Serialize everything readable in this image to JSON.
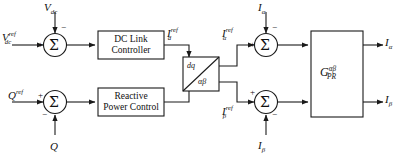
{
  "diagram": {
    "stroke_color": "#1a1a1a",
    "background_color": "#ffffff",
    "blocks": [
      {
        "id": "dc-link-controller",
        "line1": "DC Link",
        "line2": "Controller"
      },
      {
        "id": "reactive-power-control",
        "line1": "Reactive",
        "line2": "Power Control"
      },
      {
        "id": "dq-alphabeta-transform",
        "top_label": "dq",
        "bottom_label": "αβ"
      },
      {
        "id": "pr-controller",
        "base": "G",
        "sub": "PR",
        "sup": "αβ"
      }
    ],
    "summing_junctions": [
      {
        "id": "vdc-error",
        "symbol": "Σ",
        "input_sign": "+",
        "feedback_sign": "−"
      },
      {
        "id": "q-error",
        "symbol": "Σ",
        "input_sign": "+",
        "feedback_sign": "−"
      },
      {
        "id": "ialpha-error",
        "symbol": "Σ",
        "input_sign": "+",
        "feedback_sign": "−"
      },
      {
        "id": "ibeta-error",
        "symbol": "Σ",
        "input_sign": "+",
        "feedback_sign": "−"
      }
    ],
    "signals": {
      "vdc_ref": {
        "base": "V",
        "sub": "dc",
        "sup": "ref"
      },
      "vdc_feedback": {
        "base": "V",
        "sub": "dc",
        "sup": ""
      },
      "q_ref": {
        "base": "Q",
        "sub": "",
        "sup": "ref"
      },
      "q_feedback": {
        "base": "Q",
        "sub": "",
        "sup": ""
      },
      "id_ref": {
        "base": "I",
        "sub": "d",
        "sup": "ref"
      },
      "ialpha_ref": {
        "base": "I",
        "sub": "α",
        "sup": "ref"
      },
      "ibeta_ref": {
        "base": "I",
        "sub": "β",
        "sup": "ref"
      },
      "ialpha_feedback": {
        "base": "I",
        "sub": "α",
        "sup": ""
      },
      "ibeta_feedback": {
        "base": "I",
        "sub": "β",
        "sup": ""
      },
      "ialpha_out": {
        "base": "I",
        "sub": "α",
        "sup": ""
      },
      "ibeta_out": {
        "base": "I",
        "sub": "β",
        "sup": ""
      }
    }
  }
}
